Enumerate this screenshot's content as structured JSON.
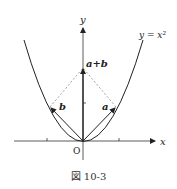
{
  "figure": {
    "caption": "図 10-3",
    "axes": {
      "x_label": "x",
      "y_label": "y",
      "origin_label": "O"
    },
    "curve": {
      "label": "y = x²"
    },
    "vectors": [
      {
        "name": "a",
        "label": "a"
      },
      {
        "name": "b",
        "label": "b"
      },
      {
        "name": "a+b",
        "label": "a+b"
      }
    ],
    "colors": {
      "line": "#222222",
      "dashed": "#888888"
    }
  }
}
